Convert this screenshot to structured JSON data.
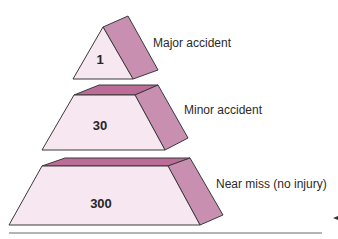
{
  "diagram": {
    "type": "accident-triangle-pyramid",
    "tiers": [
      {
        "label": "Major accident",
        "value": "1"
      },
      {
        "label": "Minor accident",
        "value": "30"
      },
      {
        "label": "Near miss (no injury)",
        "value": "300"
      }
    ],
    "colors": {
      "front_face": "#f6e7f1",
      "top_face": "#bb6d97",
      "side_face": "#c88fb0",
      "outline": "#3a3a3a"
    }
  }
}
